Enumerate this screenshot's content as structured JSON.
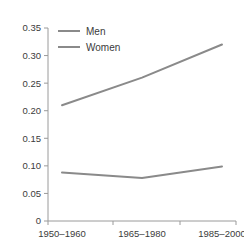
{
  "chart_data": {
    "type": "line",
    "title": "",
    "subtitle": "",
    "xlabel": "",
    "ylabel": "",
    "categories": [
      "1950–1960",
      "1965–1980",
      "1985–2000"
    ],
    "series": [
      {
        "name": "Men",
        "values": [
          0.21,
          0.26,
          0.32
        ],
        "color": "#8a8a8a"
      },
      {
        "name": "Women",
        "values": [
          0.088,
          0.078,
          0.099
        ],
        "color": "#8a8a8a"
      }
    ],
    "ylim": [
      0,
      0.35
    ],
    "yticks": [
      0,
      0.05,
      0.1,
      0.15,
      0.2,
      0.25,
      0.3,
      0.35
    ],
    "ytick_labels": [
      "0",
      "0.05",
      "0.10",
      "0.15",
      "0.20",
      "0.25",
      "0.30",
      "0.35"
    ],
    "xtick_labels": [
      "1950–1960",
      "1965–1980",
      "1985–2000"
    ],
    "grid": false,
    "legend": {
      "position": "top-left-inside",
      "entries": [
        "Men",
        "Women"
      ]
    },
    "axis_color": "#9a9a9a",
    "text_color": "#3b3b3b",
    "background": "#ffffff"
  }
}
